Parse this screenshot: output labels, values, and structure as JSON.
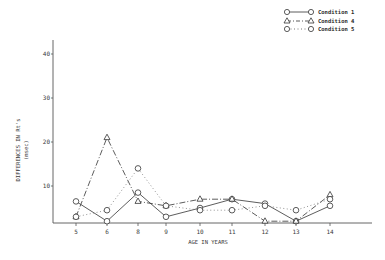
{
  "chart_data": {
    "type": "line",
    "title": "",
    "xlabel": "AGE IN YEARS",
    "ylabel": "DIFFERENCES IN Rt's",
    "ylabel_unit": "(msec)",
    "x": [
      5,
      6,
      8,
      9,
      10,
      11,
      12,
      13,
      14
    ],
    "categories": [
      "5",
      "6",
      "8",
      "9",
      "10",
      "11",
      "12",
      "13",
      "14"
    ],
    "y_ticks": [
      "10",
      "20",
      "30",
      "40"
    ],
    "ylim": [
      0,
      45
    ],
    "grid": false,
    "legend_position": "top-right",
    "series": [
      {
        "name": "Condition 1",
        "marker": "circle",
        "line": "solid",
        "values": [
          6.5,
          2,
          8.5,
          3,
          5,
          7,
          6,
          2,
          5.5
        ]
      },
      {
        "name": "Condition 4",
        "marker": "triangle",
        "line": "dash-dot",
        "values": [
          3,
          21,
          6.5,
          5.5,
          7,
          7,
          2,
          2,
          8
        ]
      },
      {
        "name": "Condition 5",
        "marker": "circle",
        "line": "dotted",
        "values": [
          3,
          4.5,
          14,
          5.5,
          4.5,
          4.5,
          5.5,
          4.5,
          7
        ]
      }
    ]
  },
  "legend": {
    "items": [
      {
        "label": "Condition 1"
      },
      {
        "label": "Condition 4"
      },
      {
        "label": "Condition 5"
      }
    ]
  },
  "axes": {
    "x_title": "AGE IN YEARS",
    "y_title": "DIFFERENCES IN Rt's",
    "y_unit": "(msec)"
  }
}
